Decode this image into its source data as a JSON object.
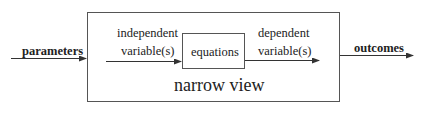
{
  "diagram": {
    "input_label": "parameters",
    "output_label": "outcomes",
    "outer_box_label": "narrow view",
    "inner_box_label": "equations",
    "independent_label_line1": "independent",
    "independent_label_line2": "variable(s)",
    "dependent_label_line1": "dependent",
    "dependent_label_line2": "variable(s)",
    "colors": {
      "stroke": "#333333",
      "text": "#222222",
      "background": "#ffffff"
    }
  }
}
